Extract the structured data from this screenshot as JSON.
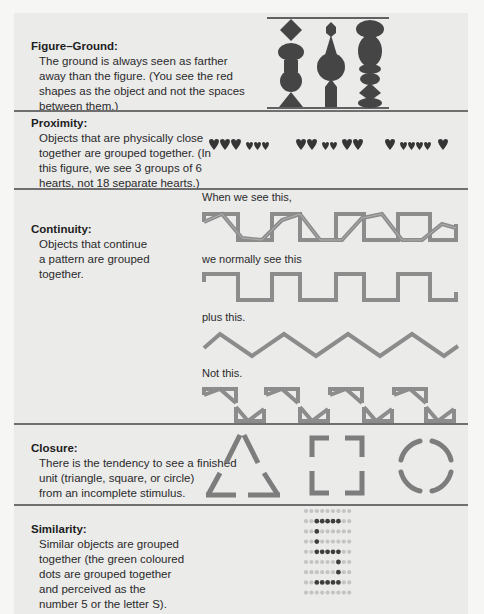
{
  "sections": [
    {
      "id": "figure-ground",
      "title": "Figure–Ground:",
      "description": "The ground is always seen as farther away than the figure. (You see the red shapes as the object and not the spaces between them.)",
      "description_lines": [
        "The ground is always seen as farther",
        "away than the figure. (You see the red",
        "shapes as the object and not the spaces",
        "between them.)"
      ]
    },
    {
      "id": "proximity",
      "title": "Proximity:",
      "description_lines": [
        "Objects that are physically close",
        "together are grouped together. (In",
        "this figure, we see 3 groups of 6",
        "hearts, not 18 separate hearts.)"
      ],
      "heart_groups": [
        [
          "L",
          "L",
          "L",
          "S",
          "S",
          "S"
        ],
        [
          "L",
          "L",
          "S",
          "S",
          "L",
          "L"
        ],
        [
          "L",
          "S",
          "S",
          "S",
          "S",
          "L"
        ]
      ]
    },
    {
      "id": "continuity",
      "title": "Continuity:",
      "description_lines": [
        "Objects that continue",
        "a pattern are grouped",
        "together."
      ],
      "captions": [
        "When we see this,",
        "we normally see this",
        "plus this.",
        "Not this."
      ]
    },
    {
      "id": "closure",
      "title": "Closure:",
      "description_lines": [
        "There is the tendency to see a finished",
        "unit (triangle, square, or circle)",
        "from an incomplete stimulus."
      ],
      "shapes": [
        "triangle",
        "square",
        "circle"
      ]
    },
    {
      "id": "similarity",
      "title": "Similarity:",
      "description_lines": [
        "Similar objects are grouped",
        "together (the green coloured",
        "dots are grouped together",
        "and perceived as the",
        "number 5 or the letter S)."
      ],
      "dot_grid": [
        "000000000",
        "001111100",
        "001000000",
        "001000000",
        "001111100",
        "000000100",
        "000000100",
        "001111100",
        "000000000"
      ]
    }
  ],
  "colors": {
    "panel_bg": "#ebebea",
    "page_bg": "#f6f6f5",
    "divider": "#6f6f6f",
    "figure_fill": "#454545",
    "line_gray": "#8c8c8c",
    "dot_light": "#c4c4c4",
    "dot_dark": "#3e3e3e"
  }
}
